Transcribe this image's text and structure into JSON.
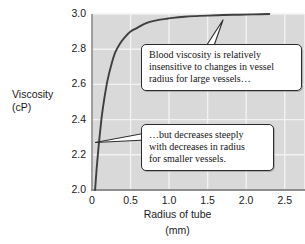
{
  "chart_data": {
    "type": "line",
    "title": "",
    "xlabel": "Radius of tube",
    "xunit": "(mm)",
    "ylabel_line1": "Viscosity",
    "ylabel_line2": "(cP)",
    "xlim": [
      0,
      2.75
    ],
    "ylim": [
      2.0,
      3.0
    ],
    "xticks": [
      "0",
      "0.5",
      "1.0",
      "1.5",
      "2.0",
      "2.5"
    ],
    "xtick_values": [
      0,
      0.5,
      1.0,
      1.5,
      2.0,
      2.5
    ],
    "yticks": [
      "2.0",
      "2.2",
      "2.4",
      "2.6",
      "2.8",
      "3.0"
    ],
    "ytick_values": [
      2.0,
      2.2,
      2.4,
      2.6,
      2.8,
      3.0
    ],
    "grid": true,
    "legend": "none",
    "series": [
      {
        "name": "Blood viscosity vs tube radius",
        "x": [
          0.04,
          0.06,
          0.08,
          0.1,
          0.13,
          0.16,
          0.2,
          0.25,
          0.3,
          0.36,
          0.43,
          0.5,
          0.58,
          0.66,
          0.75,
          0.85,
          0.95,
          1.05,
          1.2,
          1.35,
          1.5,
          1.7,
          1.9,
          2.1,
          2.3
        ],
        "y": [
          2.0,
          2.12,
          2.22,
          2.31,
          2.43,
          2.52,
          2.62,
          2.71,
          2.78,
          2.83,
          2.87,
          2.9,
          2.92,
          2.94,
          2.955,
          2.965,
          2.972,
          2.978,
          2.984,
          2.988,
          2.991,
          2.994,
          2.996,
          2.998,
          3.0
        ]
      }
    ],
    "annotations": [
      {
        "id": "callout-large-vessels",
        "lines": [
          "Blood viscosity is relatively",
          "insensitive to changes in vessel",
          "radius for large vessels…"
        ]
      },
      {
        "id": "callout-small-vessels",
        "lines": [
          "…but decreases steeply",
          "with decreases in radius",
          "for smaller vessels."
        ]
      }
    ],
    "colors": {
      "plot_background": "#d9d9d9",
      "grid": "#f2f2f2",
      "curve": "#3f3f3f",
      "text": "#1b1b1b",
      "callout_border": "#2b2b2b",
      "callout_background": "#ffffff",
      "page_background": "#ffffff"
    }
  }
}
